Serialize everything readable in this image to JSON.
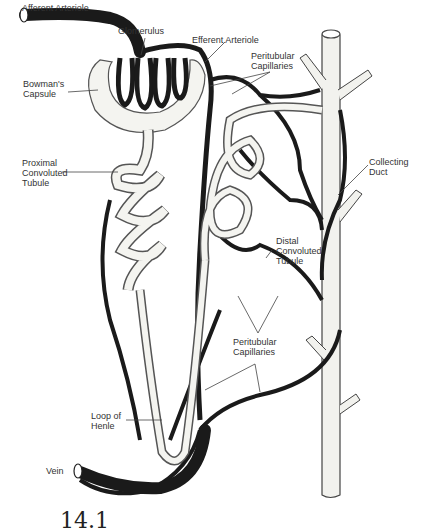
{
  "diagram": {
    "labels": {
      "afferent_arteriole": "Afferent Arteriole",
      "glomerulus": "Glomerulus",
      "efferent_arteriole": "Efferent Arteriole",
      "peritubular_capillaries_top": "Peritubular\nCapillaries",
      "bowmans_capsule": "Bowman's\nCapsule",
      "proximal_convoluted_tubule": "Proximal\nConvoluted\nTubule",
      "collecting_duct": "Collecting\nDuct",
      "distal_convoluted_tubule": "Distal\nConvoluted\nTubule",
      "peritubular_capillaries_bottom": "Peritubular\nCapillaries",
      "loop_of_henle": "Loop of\nHenle",
      "vein": "Vein"
    },
    "figure_number_partial": "14.1"
  },
  "colors": {
    "vessel": "#1a1a1a",
    "tubule_fill": "#f4f4f0",
    "tubule_stroke": "#555555",
    "leader": "#444444"
  }
}
